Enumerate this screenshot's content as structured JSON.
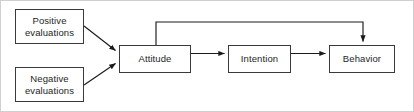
{
  "diagram": {
    "type": "flow-diagram",
    "background_color": "#ffffff",
    "frame_color": "#cfcfcf",
    "node_border_color": "#3a3a3a",
    "node_fill_color": "#ffffff",
    "edge_color": "#1a1a1a",
    "text_color": "#1e1e1e",
    "nodes": [
      {
        "id": "positive",
        "label": "Positive\nevaluations"
      },
      {
        "id": "negative",
        "label": "Negative\nevaluations"
      },
      {
        "id": "attitude",
        "label": "Attitude"
      },
      {
        "id": "intention",
        "label": "Intention"
      },
      {
        "id": "behavior",
        "label": "Behavior"
      }
    ],
    "edges": [
      {
        "id": "positive-to-attitude",
        "from": "positive",
        "to": "attitude",
        "style": "diagonal"
      },
      {
        "id": "negative-to-attitude",
        "from": "negative",
        "to": "attitude",
        "style": "diagonal"
      },
      {
        "id": "attitude-to-intention",
        "from": "attitude",
        "to": "intention",
        "style": "straight"
      },
      {
        "id": "intention-to-behavior",
        "from": "intention",
        "to": "behavior",
        "style": "straight"
      },
      {
        "id": "attitude-to-behavior",
        "from": "attitude",
        "to": "behavior",
        "style": "orthogonal-top"
      }
    ]
  }
}
